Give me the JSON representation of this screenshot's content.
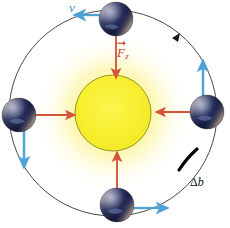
{
  "figure": {
    "width": 230,
    "height": 228,
    "background_color": "#ffffff"
  },
  "colors": {
    "background": "#ffffff",
    "sun_core": "#f6ee2a",
    "sun_glow": "#fbf07a",
    "sun_outline": "#8a8a22",
    "orbit_line": "#4a4a4a",
    "force_arrow": "#d4553a",
    "force_shaft": "#e2a08c",
    "velocity_arrow": "#4fa3d4",
    "velocity_shaft": "#9ecfe8",
    "earth_dark": "#1b2147",
    "earth_mid": "#3a3f74",
    "earth_light": "#c8b49a",
    "arc_highlight": "#000000",
    "label_velocity": "#3f8fc4",
    "label_force": "#c4452a",
    "label_delta_b": "#111111"
  },
  "sun": {
    "name": "Sun",
    "center_x": 113,
    "center_y": 113,
    "radius": 38,
    "glow_radius": 78
  },
  "orbit": {
    "name": "Earth orbit",
    "center_x": 113,
    "center_y": 113,
    "radius_x": 104,
    "radius_y": 103,
    "direction": "clockwise",
    "direction_marker_angle_deg": 315,
    "stroke_width": 1
  },
  "labels": {
    "velocity": {
      "text": "v",
      "full": "v⃗",
      "meaning": "velocity vector",
      "x": 69,
      "y": 1,
      "color": "#3f8fc4"
    },
    "force": {
      "text": "F",
      "subscript": "z",
      "full": "F⃗z",
      "meaning": "centripetal / gravitational force vector",
      "x": 117,
      "y": 46,
      "color": "#c4452a"
    },
    "delta_b": {
      "delta": "Δ",
      "letter": "b",
      "full": "Δb",
      "meaning": "arc length increment along the orbit",
      "x": 190,
      "y": 176,
      "color": "#111111"
    }
  },
  "bodies": [
    {
      "id": "earth-top",
      "name": "Earth at top of orbit",
      "x": 116,
      "y": 19,
      "radius": 17,
      "force_vector": {
        "direction": "down",
        "label": "F⃗z",
        "length": 56
      },
      "velocity_vector": {
        "direction": "left",
        "label": "v⃗",
        "length": 34
      }
    },
    {
      "id": "earth-left",
      "name": "Earth at left of orbit",
      "x": 19,
      "y": 115,
      "radius": 17,
      "force_vector": {
        "direction": "right",
        "label": "F⃗z",
        "length": 56
      },
      "velocity_vector": {
        "direction": "down",
        "label": "v⃗",
        "length": 46
      }
    },
    {
      "id": "earth-right",
      "name": "Earth at right of orbit",
      "x": 207,
      "y": 112,
      "radius": 17,
      "force_vector": {
        "direction": "left",
        "label": "F⃗z",
        "length": 56
      },
      "velocity_vector": {
        "direction": "up",
        "label": "v⃗",
        "length": 48
      }
    },
    {
      "id": "earth-bottom",
      "name": "Earth at bottom of orbit",
      "x": 117,
      "y": 205,
      "radius": 17,
      "force_vector": {
        "direction": "up",
        "label": "F⃗z",
        "length": 56
      },
      "velocity_vector": {
        "direction": "right",
        "label": "v⃗",
        "length": 42
      }
    }
  ]
}
